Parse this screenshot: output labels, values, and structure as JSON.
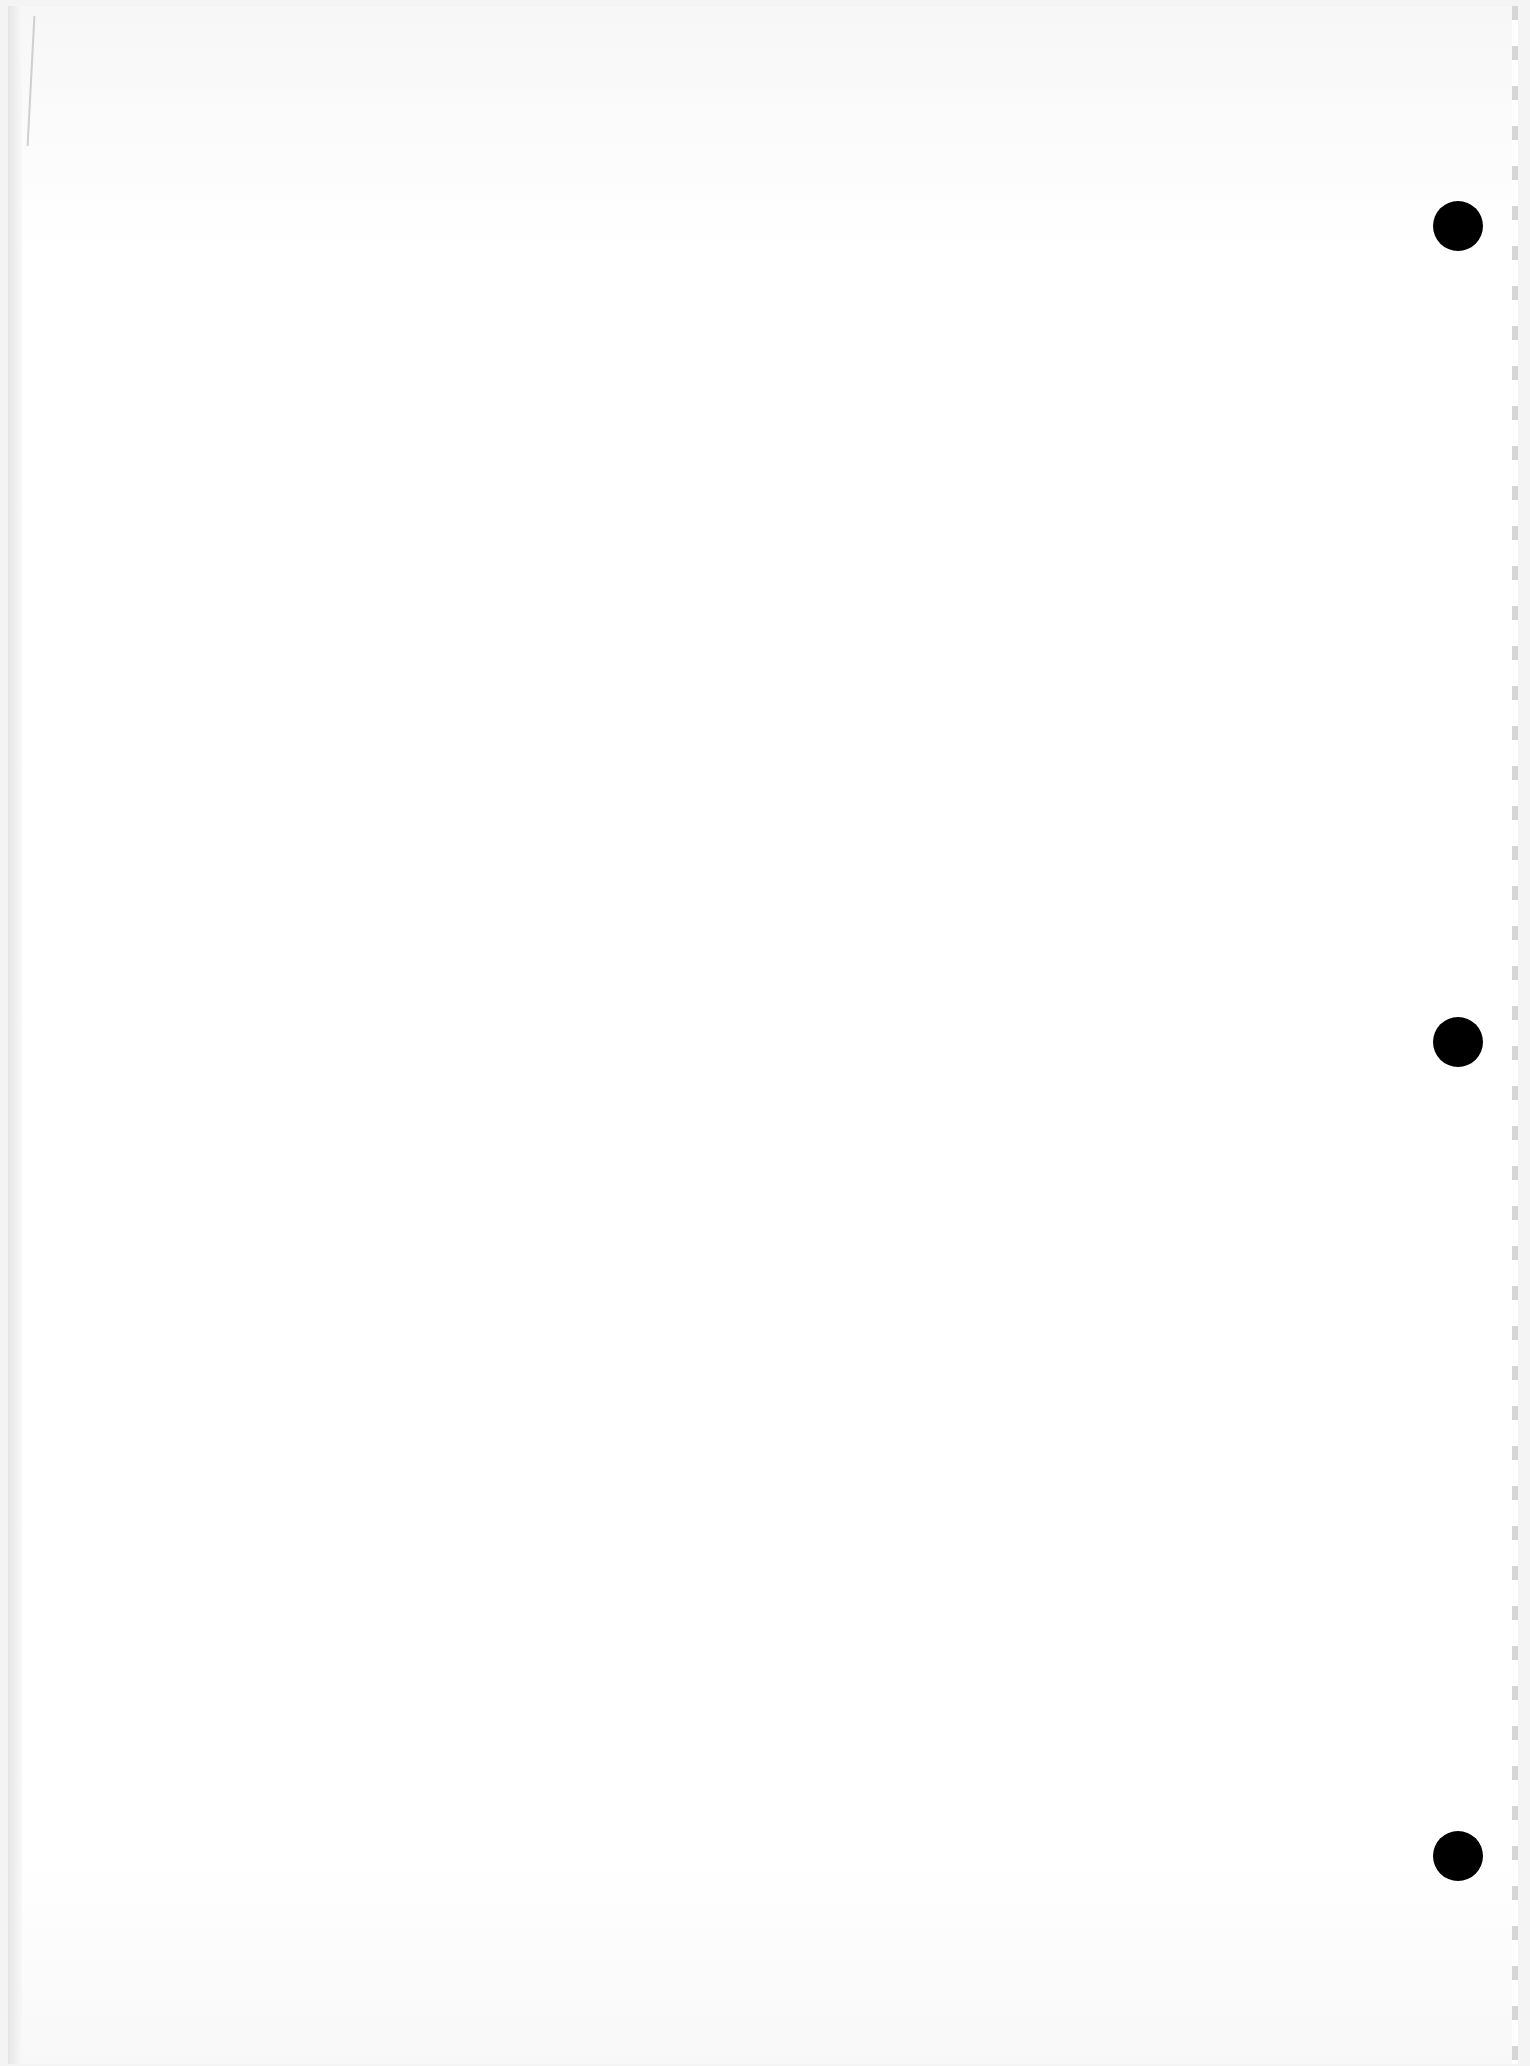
{
  "document": {
    "type": "blank scanned page",
    "text": "",
    "punch_holes": [
      {
        "x": 1456,
        "y": 220
      },
      {
        "x": 1456,
        "y": 1036
      },
      {
        "x": 1456,
        "y": 1850
      }
    ]
  }
}
